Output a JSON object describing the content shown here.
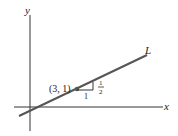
{
  "diagram": {
    "axes": {
      "x_label": "x",
      "y_label": "y",
      "color": "#333333"
    },
    "line": {
      "label": "L",
      "color": "#555555"
    },
    "point": {
      "label": "(3, 1)",
      "color": "#555555"
    },
    "slope_triangle": {
      "run_label": "1",
      "rise_numerator": "1",
      "rise_denominator": "2"
    }
  }
}
